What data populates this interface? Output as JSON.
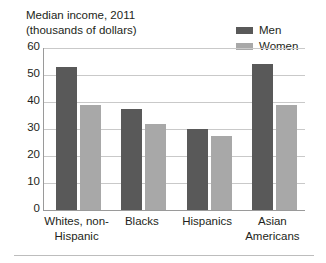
{
  "chart_data": {
    "type": "bar",
    "title": "Median income, 2011",
    "subtitle": "(thousands of dollars)",
    "xlabel": "",
    "ylabel": "",
    "ylim": [
      0,
      60
    ],
    "yticks": [
      0,
      10,
      20,
      30,
      40,
      50,
      60
    ],
    "grid": true,
    "legend_position": "top-right",
    "categories": [
      "Whites, non-Hispanic",
      "Blacks",
      "Hispanics",
      "Asian Americans"
    ],
    "series": [
      {
        "name": "Men",
        "color": "#595959",
        "values": [
          53,
          37.5,
          30,
          54
        ]
      },
      {
        "name": "Women",
        "color": "#a8a8a8",
        "values": [
          39,
          32,
          27.5,
          39
        ]
      }
    ]
  },
  "title_lines": [
    "Median income, 2011",
    "(thousands of dollars)"
  ],
  "legend": {
    "items": [
      {
        "label": "Men",
        "color": "#595959"
      },
      {
        "label": "Women",
        "color": "#a8a8a8"
      }
    ]
  },
  "category_labels": [
    [
      "Whites, non-",
      "Hispanic"
    ],
    [
      "Blacks",
      ""
    ],
    [
      "Hispanics",
      ""
    ],
    [
      "Asian",
      "Americans"
    ]
  ],
  "colors": {
    "men": "#595959",
    "women": "#a8a8a8",
    "gridline": "#c9c9c9",
    "axis": "#9a9a9a",
    "text": "#231f20",
    "background": "#ffffff"
  }
}
